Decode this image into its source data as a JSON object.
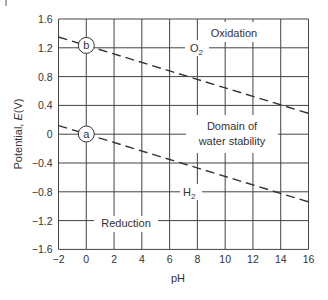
{
  "chart_data": {
    "type": "line",
    "title": "",
    "xlabel": "pH",
    "ylabel": "Potential, E(V)",
    "xlim": [
      -2,
      16
    ],
    "ylim": [
      -1.6,
      1.6
    ],
    "x_ticks": [
      "−2",
      "0",
      "2",
      "4",
      "6",
      "8",
      "10",
      "12",
      "14",
      "16"
    ],
    "y_ticks": [
      "1.6",
      "1.2",
      "0.8",
      "0.4",
      "0",
      "−0.4",
      "−0.8",
      "−1.2",
      "−1.6"
    ],
    "grid": true,
    "series": [
      {
        "name": "b",
        "label": "O2",
        "style": "dashed",
        "x": [
          -2,
          16
        ],
        "values": [
          1.35,
          0.29
        ]
      },
      {
        "name": "a",
        "label": "H2",
        "style": "dashed",
        "x": [
          -2,
          16
        ],
        "values": [
          0.12,
          -0.94
        ]
      }
    ],
    "annotations": [
      {
        "text": "Oxidation",
        "x": 11,
        "y": 1.33
      },
      {
        "text": "O2",
        "x": 7.5,
        "y": 1.2
      },
      {
        "text": "Domain of",
        "x": 9.5,
        "y": 0.25
      },
      {
        "text": "water stability",
        "x": 9.5,
        "y": 0.05
      },
      {
        "text": "H2",
        "x": 7.5,
        "y": -0.8
      },
      {
        "text": "Reduction",
        "x": 3,
        "y": -1.2
      },
      {
        "text": "b",
        "x": 0,
        "y": 1.23
      },
      {
        "text": "a",
        "x": 0,
        "y": 0
      }
    ]
  },
  "labels": {
    "xlabel": "pH",
    "ylabel_main": "Potential, ",
    "ylabel_italic": "E",
    "ylabel_unit": "(V)",
    "oxidation": "Oxidation",
    "o2_base": "O",
    "o2_sub": "2",
    "h2_base": "H",
    "h2_sub": "2",
    "domain1": "Domain of",
    "domain2": "water stability",
    "reduction": "Reduction",
    "marker_b": "b",
    "marker_a": "a"
  }
}
